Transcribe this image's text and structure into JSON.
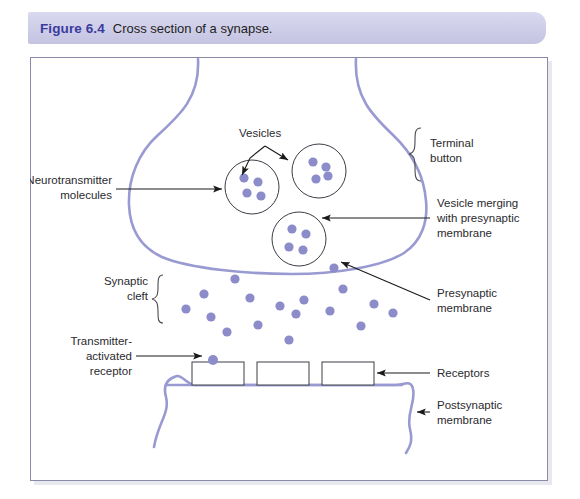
{
  "caption": {
    "figure_number": "Figure 6.4",
    "text": "Cross section of a synapse."
  },
  "colors": {
    "membrane": "#9a9ad2",
    "vesicle_dot": "#8c8ccb",
    "caption_band": "#cdcde8",
    "caption_figno": "#3b3b9e",
    "label_text": "#2a2a2e",
    "panel_border": "#8a8aa8",
    "leader_line": "#1a1a1a"
  },
  "labels": {
    "vesicles": "Vesicles",
    "neurotransmitter_line1": "Neurotransmitter",
    "neurotransmitter_line2": "molecules",
    "terminal_button_line1": "Terminal",
    "terminal_button_line2": "button",
    "vesicle_merging_line1": "Vesicle merging",
    "vesicle_merging_line2": "with presynaptic",
    "vesicle_merging_line3": "membrane",
    "presynaptic_line1": "Presynaptic",
    "presynaptic_line2": "membrane",
    "synaptic_cleft_line1": "Synaptic",
    "synaptic_cleft_line2": "cleft",
    "transmitter_receptor_line1": "Transmitter-",
    "transmitter_receptor_line2": "activated",
    "transmitter_receptor_line3": "receptor",
    "receptors": "Receptors",
    "postsynaptic_line1": "Postsynaptic",
    "postsynaptic_line2": "membrane"
  },
  "diagram": {
    "vesicles": [
      {
        "cx": 222,
        "cy": 130,
        "r": 27,
        "dots": [
          [
            214,
            121
          ],
          [
            228,
            125
          ],
          [
            217,
            136
          ],
          [
            231,
            139
          ]
        ]
      },
      {
        "cx": 289,
        "cy": 114,
        "r": 27,
        "dots": [
          [
            283,
            105
          ],
          [
            296,
            110
          ],
          [
            286,
            122
          ],
          [
            298,
            119
          ]
        ]
      },
      {
        "cx": 269,
        "cy": 182,
        "r": 27,
        "dots": [
          [
            262,
            172
          ],
          [
            276,
            177
          ],
          [
            259,
            190
          ],
          [
            273,
            193
          ]
        ]
      }
    ],
    "cleft_dots": [
      [
        205,
        222
      ],
      [
        174,
        237
      ],
      [
        156,
        252
      ],
      [
        220,
        241
      ],
      [
        181,
        260
      ],
      [
        250,
        249
      ],
      [
        274,
        243
      ],
      [
        266,
        257
      ],
      [
        228,
        268
      ],
      [
        197,
        275
      ],
      [
        259,
        283
      ],
      [
        300,
        254
      ],
      [
        304,
        211
      ],
      [
        313,
        232
      ],
      [
        331,
        269
      ],
      [
        344,
        247
      ],
      [
        363,
        256
      ],
      [
        213,
        305
      ]
    ],
    "receptor_boxes": [
      {
        "x": 162,
        "y": 305,
        "w": 52,
        "h": 23
      },
      {
        "x": 227,
        "y": 305,
        "w": 52,
        "h": 23
      },
      {
        "x": 292,
        "y": 305,
        "w": 52,
        "h": 23
      }
    ],
    "receptor_bound_dot": {
      "cx": 183,
      "cy": 303,
      "r": 5
    }
  }
}
